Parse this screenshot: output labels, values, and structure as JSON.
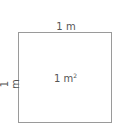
{
  "diagram": {
    "top_label": "1 m",
    "side_label": "1 m",
    "area_value": "1 m",
    "area_exponent": "2",
    "colors": {
      "stroke": "#9a9a9a",
      "text": "#555555"
    }
  }
}
